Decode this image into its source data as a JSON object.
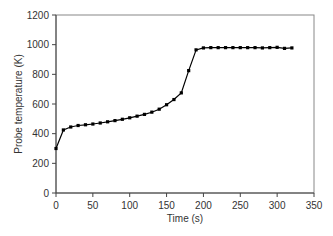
{
  "chart_data": {
    "type": "line",
    "title": "",
    "xlabel": "Time (s)",
    "ylabel": "Probe temperature (K)",
    "xlim": [
      0,
      350
    ],
    "ylim": [
      0,
      1200
    ],
    "xticks": [
      0,
      50,
      100,
      150,
      200,
      250,
      300,
      350
    ],
    "yticks": [
      0,
      200,
      400,
      600,
      800,
      1000,
      1200
    ],
    "grid": false,
    "legend": null,
    "series": [
      {
        "name": "Probe temperature",
        "marker": "square",
        "color": "#000000",
        "x": [
          0,
          10,
          20,
          30,
          40,
          50,
          60,
          70,
          80,
          90,
          100,
          110,
          120,
          130,
          140,
          150,
          160,
          170,
          180,
          190,
          200,
          210,
          220,
          230,
          240,
          250,
          260,
          270,
          280,
          290,
          300,
          310,
          320
        ],
        "y": [
          300,
          425,
          445,
          455,
          460,
          465,
          472,
          480,
          488,
          497,
          507,
          518,
          530,
          545,
          565,
          595,
          630,
          675,
          825,
          965,
          978,
          980,
          980,
          980,
          980,
          980,
          980,
          980,
          978,
          980,
          982,
          975,
          978
        ]
      }
    ]
  }
}
